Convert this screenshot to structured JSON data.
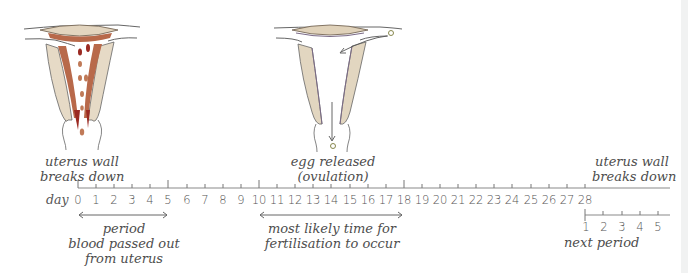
{
  "illustrations": [
    {
      "id": "uterus-breakdown",
      "caption_line1": "uterus wall",
      "caption_line2": "breaks down"
    },
    {
      "id": "ovulation",
      "caption_line1": "egg released",
      "caption_line2": "(ovulation)"
    }
  ],
  "right_caption": {
    "line1": "uterus wall",
    "line2": "breaks down"
  },
  "timeline": {
    "axis_label": "day",
    "days": [
      "0",
      "1",
      "2",
      "3",
      "4",
      "5",
      "6",
      "7",
      "8",
      "9",
      "10",
      "11",
      "12",
      "13",
      "14",
      "15",
      "16",
      "17",
      "18",
      "19",
      "20",
      "21",
      "22",
      "23",
      "24",
      "25",
      "26",
      "27",
      "28"
    ],
    "major_ticks": [
      "0",
      "5",
      "10",
      "18",
      "28"
    ]
  },
  "ranges": [
    {
      "id": "period",
      "from": "0",
      "to": "5",
      "line1": "period",
      "line2": "blood passed out",
      "line3": "from uterus"
    },
    {
      "id": "fertilisation",
      "from": "10",
      "to": "18",
      "line1": "most likely time for",
      "line2": "fertilisation to occur"
    }
  ],
  "next_period": {
    "days": [
      "1",
      "2",
      "3",
      "4",
      "5"
    ],
    "label": "next period"
  },
  "colors": {
    "uterus_fill": "#e3d7c3",
    "lining": "#b5674a",
    "blood": "#9b2a22",
    "outline": "#5a5a5a",
    "inner_line": "#7a6a86",
    "axis": "#8a8a8a"
  }
}
